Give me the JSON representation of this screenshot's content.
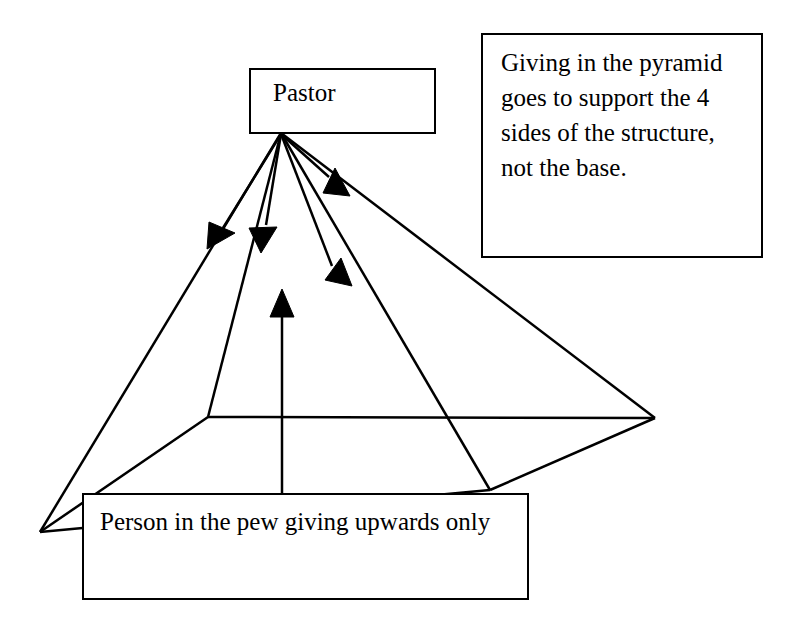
{
  "diagram": {
    "background_color": "#ffffff",
    "stroke_color": "#000000"
  },
  "boxes": {
    "pastor": {
      "label": "Pastor"
    },
    "note": {
      "label": "Giving in the pyramid goes to support the 4 sides of the structure, not the base."
    },
    "pew": {
      "label": "Person in the pew giving upwards only"
    }
  },
  "arrows": {
    "downward": [
      {
        "name": "pastor-to-left-outer",
        "from": [
          281,
          134
        ],
        "to": [
          212,
          243
        ]
      },
      {
        "name": "pastor-to-left-inner",
        "from": [
          281,
          134
        ],
        "to": [
          262,
          243
        ]
      },
      {
        "name": "pastor-to-right-upper",
        "from": [
          281,
          134
        ],
        "to": [
          345,
          190
        ]
      },
      {
        "name": "pastor-to-right-lower",
        "from": [
          281,
          134
        ],
        "to": [
          348,
          281
        ]
      }
    ],
    "upward": [
      {
        "name": "pew-to-pastor",
        "from": [
          282,
          493
        ],
        "to": [
          282,
          291
        ]
      }
    ]
  },
  "pyramid": {
    "apex": [
      281,
      133
    ],
    "left_corner": [
      40,
      532
    ],
    "right_corner": [
      655,
      418
    ],
    "front_corner": [
      490,
      490
    ],
    "back_corner": [
      208,
      417
    ],
    "edges": [
      "apex-left",
      "apex-right",
      "apex-front",
      "apex-back",
      "base-left-front",
      "base-front-right",
      "base-right-back",
      "base-back-left"
    ]
  }
}
